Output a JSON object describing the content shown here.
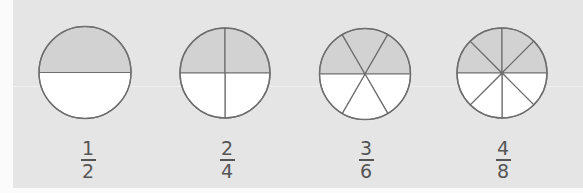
{
  "diagram": {
    "colors": {
      "background": "#e5e5e5",
      "shaded": "#d2d2d2",
      "unshaded": "#ffffff",
      "stroke": "#6e6e6e",
      "text": "#555555"
    },
    "circles": [
      {
        "cx": 85,
        "cy": 72.5,
        "r": 46,
        "parts": 2,
        "shaded": 1,
        "fraction": {
          "numerator": "1",
          "denominator": "2"
        },
        "label_x": 88
      },
      {
        "cx": 225,
        "cy": 73,
        "r": 45,
        "parts": 4,
        "shaded": 2,
        "fraction": {
          "numerator": "2",
          "denominator": "4"
        },
        "label_x": 227
      },
      {
        "cx": 365,
        "cy": 74,
        "r": 45.5,
        "parts": 6,
        "shaded": 3,
        "fraction": {
          "numerator": "3",
          "denominator": "6"
        },
        "label_x": 366
      },
      {
        "cx": 502,
        "cy": 73,
        "r": 45,
        "parts": 8,
        "shaded": 4,
        "fraction": {
          "numerator": "4",
          "denominator": "8"
        },
        "label_x": 503
      }
    ]
  }
}
